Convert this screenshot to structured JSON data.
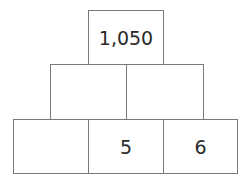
{
  "pyramid": {
    "rows": [
      {
        "bricks": [
          {
            "value": "1,050"
          }
        ]
      },
      {
        "bricks": [
          {
            "value": ""
          },
          {
            "value": ""
          }
        ]
      },
      {
        "bricks": [
          {
            "value": ""
          },
          {
            "value": "5"
          },
          {
            "value": "6"
          }
        ]
      }
    ],
    "colors": {
      "border": "#7a7a7a",
      "text": "#2a2a2a",
      "background": "#ffffff"
    }
  }
}
